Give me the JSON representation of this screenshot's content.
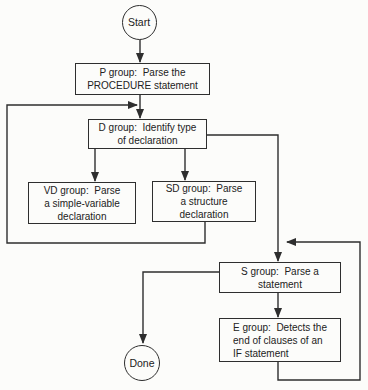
{
  "diagram": {
    "type": "flowchart",
    "colors": {
      "line": "#2e2e2e",
      "text": "#222222",
      "background": "#fcfcfa"
    },
    "nodes": {
      "start": {
        "shape": "circle",
        "label": "Start"
      },
      "p": {
        "shape": "rect",
        "lines": [
          "P group:  Parse the",
          "PROCEDURE statement"
        ]
      },
      "d": {
        "shape": "rect",
        "lines": [
          "D group:  Identify type",
          "of declaration"
        ]
      },
      "vd": {
        "shape": "rect",
        "lines": [
          "VD group:  Parse",
          "a simple-variable",
          "declaration"
        ]
      },
      "sd": {
        "shape": "rect",
        "lines": [
          "SD group:  Parse",
          "a structure",
          "declaration"
        ]
      },
      "s": {
        "shape": "rect",
        "lines": [
          "S group:  Parse a",
          "statement"
        ]
      },
      "e": {
        "shape": "rect",
        "lines": [
          "E group:  Detects the",
          "end of clauses of an",
          "IF statement"
        ]
      },
      "done": {
        "shape": "circle",
        "label": "Done"
      }
    },
    "edges": [
      {
        "from": "start",
        "to": "p"
      },
      {
        "from": "p",
        "to": "d"
      },
      {
        "from": "sd",
        "to": "d",
        "note": "loop left, joins p-to-d line"
      },
      {
        "from": "d",
        "to": "vd"
      },
      {
        "from": "d",
        "to": "sd"
      },
      {
        "from": "d",
        "to": "s",
        "note": "exits right side of d"
      },
      {
        "from": "s",
        "to": "e"
      },
      {
        "from": "e",
        "to": "s",
        "note": "loop right, joins d-to-s line"
      },
      {
        "from": "s",
        "to": "done",
        "note": "exits left side of s"
      }
    ]
  }
}
